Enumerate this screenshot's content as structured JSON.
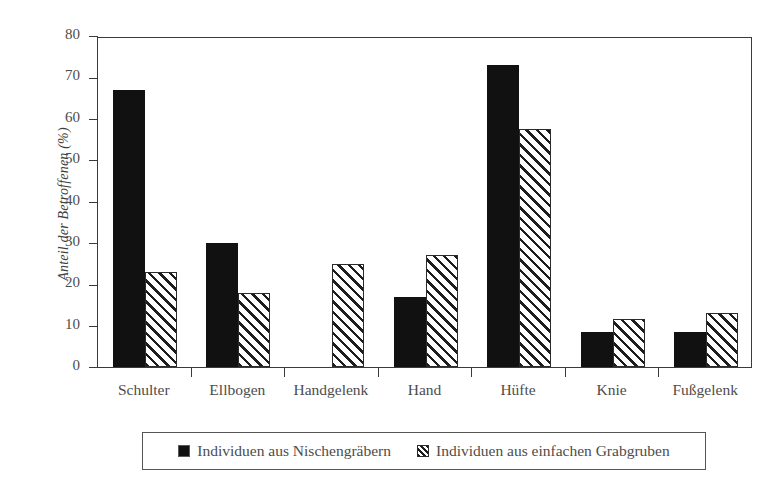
{
  "chart_data": {
    "type": "bar",
    "title": "",
    "xlabel": "",
    "ylabel": "Anteil der Betroffenen (%)",
    "ylim": [
      0,
      80
    ],
    "yticks": [
      0,
      10,
      20,
      30,
      40,
      50,
      60,
      70,
      80
    ],
    "grid": false,
    "legend_position": "bottom",
    "categories": [
      "Schulter",
      "Ellbogen",
      "Handgelenk",
      "Hand",
      "Hüfte",
      "Knie",
      "Fußgelenk"
    ],
    "series": [
      {
        "name": "Individuen aus Nischengräbern",
        "fill": "solid-black",
        "color": "#111111",
        "values": [
          67,
          30,
          0,
          17,
          73,
          8.5,
          8.5
        ]
      },
      {
        "name": "Individuen aus einfachen Grabgruben",
        "fill": "diagonal-hatch",
        "color": "#ffffff",
        "values": [
          23,
          18,
          25,
          27,
          57.5,
          11.5,
          13
        ]
      }
    ]
  },
  "legend": {
    "entries": [
      {
        "label": "Individuen aus Nischengräbern",
        "swatch": "solid-square-icon"
      },
      {
        "label": "Individuen aus einfachen Grabgruben",
        "swatch": "hatched-square-icon"
      }
    ]
  },
  "colors": {
    "background": "#ffffff",
    "axis": "#3a3a3a",
    "text": "#4d4d4d",
    "series_solid": "#111111",
    "series_hatch_line": "#1d1d1d"
  }
}
